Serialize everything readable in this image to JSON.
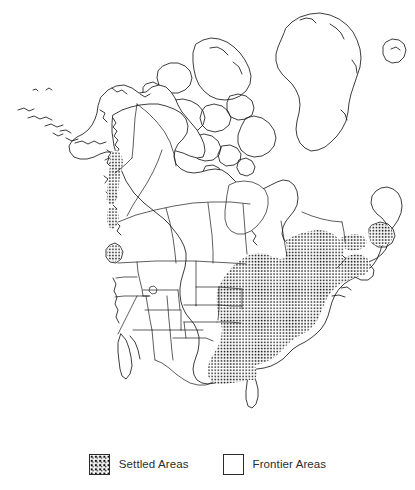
{
  "figure": {
    "type": "thematic-map",
    "region": "North America",
    "background_color": "#ffffff",
    "line_color": "#1a1a1a",
    "stipple_color": "#111111"
  },
  "legend": {
    "items": [
      {
        "label": "Settled Areas",
        "swatch": "stipple-swatch",
        "pattern": "dotted-stipple",
        "fill_color": "#111111"
      },
      {
        "label": "Frontier Areas",
        "swatch": "empty-swatch",
        "pattern": "blank",
        "fill_color": "#ffffff"
      }
    ]
  },
  "map_features": {
    "settled_regions": [
      "Northeastern United States",
      "Mid-Atlantic United States",
      "Southeastern United States",
      "Ohio Valley",
      "Great Lakes states",
      "Eastern Texas",
      "Gulf Coast",
      "Southern Ontario",
      "Southern Quebec",
      "Saint Lawrence Valley",
      "Maritime Provinces",
      "Newfoundland coast",
      "British Columbia coastal strip"
    ],
    "frontier_regions": [
      "Alaska",
      "Yukon",
      "Northwest Territories",
      "Nunavut",
      "Greenland",
      "Canadian Arctic Archipelago",
      "Prairie Provinces",
      "Western United States",
      "Great Plains",
      "Rocky Mountain states",
      "Florida peninsula",
      "Northern Mexico"
    ],
    "water_bodies": [
      "Hudson Bay",
      "Great Lakes",
      "Gulf of Mexico",
      "Atlantic Ocean",
      "Pacific Ocean",
      "Arctic Ocean",
      "Great Salt Lake"
    ],
    "boundaries_shown": [
      "international borders",
      "state borders",
      "provincial borders"
    ]
  }
}
